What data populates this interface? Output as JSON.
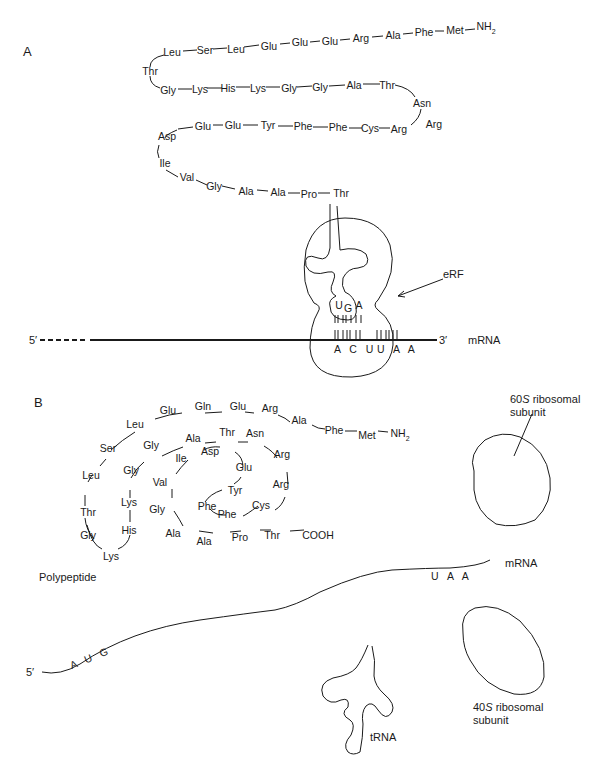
{
  "panel_a": {
    "label": "A",
    "polypeptide": {
      "row1": [
        "Leu",
        "Ser",
        "Leu",
        "Glu",
        "Glu",
        "Glu",
        "Arg",
        "Ala",
        "Phe",
        "Met"
      ],
      "n_terminus": "NH",
      "n_terminus_sub": "2",
      "turn1": "Thr",
      "row2": [
        "Gly",
        "Lys",
        "His",
        "Lys",
        "Gly",
        "Gly",
        "Ala",
        "Thr"
      ],
      "turn2": "Asn",
      "row3": [
        "Glu",
        "Glu",
        "Tyr",
        "Phe",
        "Phe",
        "Cys",
        "Arg",
        "Arg"
      ],
      "turn3": [
        "Asp",
        "Ile"
      ],
      "row4": [
        "Val",
        "Gly",
        "Ala",
        "Ala",
        "Pro",
        "Thr"
      ]
    },
    "release_factor_label": "eRF",
    "erf_anticodon_like": [
      "U",
      "G",
      "A"
    ],
    "mrna_codons": [
      "A C U",
      "U A A"
    ],
    "five_prime": "5′",
    "three_prime": "3′",
    "mrna_label": "mRNA"
  },
  "panel_b": {
    "label": "B",
    "polypeptide_label": "Polypeptide",
    "polypeptide": {
      "outer": [
        "Thr",
        "Leu",
        "Ser",
        "Leu",
        "Glu",
        "Gln",
        "Glu",
        "Arg",
        "Ala",
        "Phe",
        "Met"
      ],
      "n_terminus": "NH",
      "n_terminus_sub": "2",
      "left_loop": [
        "Gly",
        "Lys",
        "His",
        "Lys",
        "Gly",
        "Gly"
      ],
      "middle": [
        "Ala",
        "Thr",
        "Asn",
        "Arg",
        "Arg",
        "Cys",
        "Phe",
        "Phe",
        "Tyr",
        "Glu",
        "Asp",
        "Ile",
        "Val",
        "Gly",
        "Ala",
        "Ala",
        "Pro",
        "Thr"
      ],
      "c_terminus": "COOH"
    },
    "large_subunit_label": "60S ribosomal subunit",
    "large_subunit_prefix": "60",
    "large_subunit_italic": "S",
    "large_subunit_rest": " ribosomal",
    "large_subunit_line2": "subunit",
    "small_subunit_prefix": "40",
    "small_subunit_italic": "S",
    "small_subunit_rest": " ribosomal",
    "small_subunit_line2": "subunit",
    "mrna_label": "mRNA",
    "start_codon": "A U G",
    "stop_codon": "U A A",
    "five_prime": "5′",
    "trna_label": "tRNA"
  }
}
